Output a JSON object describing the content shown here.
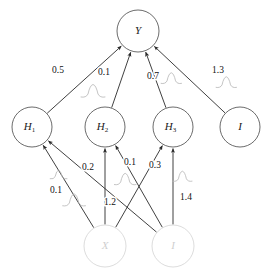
{
  "diagram": {
    "type": "causal-neural-network",
    "background_color": "#ffffff",
    "node_stroke_color": "#5a5a5a",
    "faint_node_color": "#d8d8d8",
    "edge_color": "#2a2a2a",
    "noise_color": "#b9b9b9",
    "nodes": [
      {
        "id": "Y",
        "label": "Y",
        "sub": "",
        "cx": 138,
        "cy": 31,
        "r": 21,
        "layer": "output",
        "faint": false
      },
      {
        "id": "H1",
        "label": "H",
        "sub": "1",
        "cx": 32,
        "cy": 127,
        "r": 20,
        "layer": "hidden",
        "faint": false
      },
      {
        "id": "H2",
        "label": "H",
        "sub": "2",
        "cx": 105,
        "cy": 127,
        "r": 20,
        "layer": "hidden",
        "faint": false
      },
      {
        "id": "H3",
        "label": "H",
        "sub": "3",
        "cx": 173,
        "cy": 127,
        "r": 20,
        "layer": "hidden",
        "faint": false
      },
      {
        "id": "I1",
        "label": "I",
        "sub": "",
        "cx": 240,
        "cy": 127,
        "r": 20,
        "layer": "hidden",
        "faint": false
      },
      {
        "id": "X",
        "label": "X",
        "sub": "",
        "cx": 105,
        "cy": 246,
        "r": 21,
        "layer": "input",
        "faint": true
      },
      {
        "id": "I2",
        "label": "I",
        "sub": "",
        "cx": 173,
        "cy": 246,
        "r": 21,
        "layer": "input",
        "faint": true
      }
    ],
    "edges": [
      {
        "from": "H1",
        "to": "Y",
        "weight": "0.5",
        "label_x": 58,
        "label_y": 71
      },
      {
        "from": "H2",
        "to": "Y",
        "weight": "0.1",
        "label_x": 104,
        "label_y": 73
      },
      {
        "from": "H3",
        "to": "Y",
        "weight": "0.7",
        "label_x": 153,
        "label_y": 77
      },
      {
        "from": "I1",
        "to": "Y",
        "weight": "1.3",
        "label_x": 218,
        "label_y": 71
      },
      {
        "from": "X",
        "to": "H1",
        "weight": "0.1",
        "label_x": 56,
        "label_y": 191
      },
      {
        "from": "X",
        "to": "H2",
        "weight": "1.2",
        "label_x": 110,
        "label_y": 203
      },
      {
        "from": "X",
        "to": "H3",
        "weight": "0.3",
        "label_x": 155,
        "label_y": 166
      },
      {
        "from": "I2",
        "to": "H1",
        "weight": "0.2",
        "label_x": 88,
        "label_y": 168
      },
      {
        "from": "I2",
        "to": "H2",
        "weight": "0.1",
        "label_x": 130,
        "label_y": 163
      },
      {
        "from": "I2",
        "to": "H3",
        "weight": "1.4",
        "label_x": 186,
        "label_y": 198
      }
    ],
    "noise_glyphs": [
      {
        "x": 95,
        "y": 93,
        "scale": 1.0
      },
      {
        "x": 173,
        "y": 80,
        "scale": 0.85
      },
      {
        "x": 228,
        "y": 84,
        "scale": 0.85
      },
      {
        "x": 60,
        "y": 176,
        "scale": 0.7
      },
      {
        "x": 76,
        "y": 202,
        "scale": 0.95
      },
      {
        "x": 127,
        "y": 181,
        "scale": 0.9
      },
      {
        "x": 184,
        "y": 178,
        "scale": 0.8
      }
    ]
  }
}
